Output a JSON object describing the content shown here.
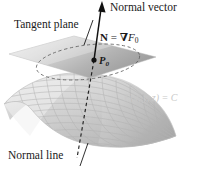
{
  "figure": {
    "background_color": "#ffffff",
    "width": 204,
    "height": 172,
    "labels": {
      "normal_vector": "Normal vector",
      "tangent_plane": "Tangent plane",
      "normal_line": "Normal line",
      "point_label": "P",
      "point_subscript": "0",
      "gradient_N": "N",
      "gradient_equals": " = ",
      "gradient_del": "∇",
      "gradient_F": "F",
      "gradient_F_sub": "0",
      "surface_equation": "F(x, y, z) = C"
    },
    "colors": {
      "ink": "#1a1a1a",
      "surface_equation_text": "#c9c9c9",
      "plane_light": "#e8e8e8",
      "plane_dark": "#9a9a9a",
      "surface_light": "#f2f2f2",
      "surface_mid": "#c6c6c6",
      "surface_dark": "#a0a0a0",
      "mesh_line": "#b0b0b0",
      "dashed_line": "#2a2a2a"
    },
    "geometry": {
      "point_P0": {
        "x": 94,
        "y": 60
      },
      "arrow_tip": {
        "x": 101,
        "y": 3
      },
      "normal_line_end": {
        "x": 77,
        "y": 158
      },
      "plane_corners": [
        {
          "x": 9,
          "y": 54
        },
        {
          "x": 74,
          "y": 36
        },
        {
          "x": 156,
          "y": 57
        },
        {
          "x": 90,
          "y": 78
        }
      ]
    }
  }
}
